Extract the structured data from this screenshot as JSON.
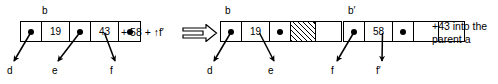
{
  "diagram": {
    "ink_color": "#000000",
    "background": "#ffffff",
    "transition_symbol": "double-right-arrow",
    "stages": [
      {
        "id": "before",
        "node_label": "b",
        "cells": [
          {
            "kind": "pointer",
            "value": ""
          },
          {
            "kind": "key",
            "value": "19"
          },
          {
            "kind": "pointer",
            "value": ""
          },
          {
            "kind": "key",
            "value": "43"
          },
          {
            "kind": "pointer",
            "value": ""
          }
        ],
        "leaf_labels": [
          "d",
          "e",
          "f"
        ],
        "annotation": "+ 58 + ↑f′"
      },
      {
        "id": "after-left",
        "node_label": "b",
        "cells": [
          {
            "kind": "pointer",
            "value": ""
          },
          {
            "kind": "key",
            "value": "19"
          },
          {
            "kind": "pointer",
            "value": ""
          },
          {
            "kind": "hatched",
            "value": ""
          },
          {
            "kind": "blank",
            "value": ""
          }
        ],
        "leaf_labels": [
          "d",
          "e"
        ],
        "annotation": ""
      },
      {
        "id": "after-right",
        "node_label": "b′",
        "cells": [
          {
            "kind": "pointer",
            "value": ""
          },
          {
            "kind": "key",
            "value": "58"
          },
          {
            "kind": "pointer",
            "value": ""
          },
          {
            "kind": "blank",
            "value": ""
          },
          {
            "kind": "blank",
            "value": ""
          }
        ],
        "leaf_labels": [
          "f",
          "f′"
        ],
        "annotation_line1": "+43 into the",
        "annotation_line2": "parent a"
      }
    ]
  }
}
